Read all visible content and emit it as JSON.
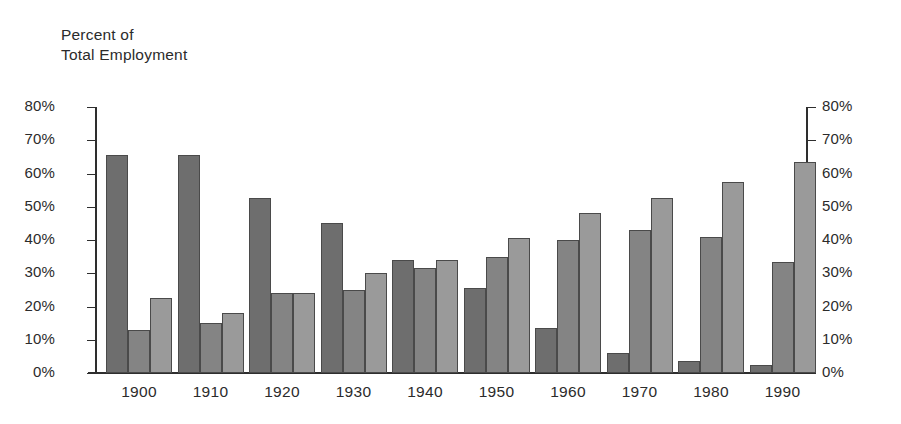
{
  "chart_data": {
    "type": "bar",
    "title": "",
    "axis_title": "Percent of\nTotal Employment",
    "xlabel": "",
    "ylabel": "Percent of Total Employment",
    "ylim": [
      0,
      80
    ],
    "grid": false,
    "legend_position": "none",
    "categories": [
      "1900",
      "1910",
      "1920",
      "1930",
      "1940",
      "1950",
      "1960",
      "1970",
      "1980",
      "1990"
    ],
    "ytick_labels": [
      "80%",
      "70%",
      "60%",
      "50%",
      "40%",
      "30%",
      "20%",
      "10%",
      "0%"
    ],
    "ytick_values": [
      80,
      70,
      60,
      50,
      40,
      30,
      20,
      10,
      0
    ],
    "right_axis_tick_labels": [
      "80%",
      "70%",
      "60%",
      "50%",
      "40%",
      "30%",
      "20%",
      "10%",
      "0%"
    ],
    "series": [
      {
        "name": "series-1",
        "color": "#6e6e6e",
        "values": [
          65.5,
          65.5,
          52.5,
          45.0,
          34.0,
          25.5,
          13.5,
          6.0,
          3.5,
          2.5
        ]
      },
      {
        "name": "series-2",
        "color": "#848484",
        "values": [
          13.0,
          15.0,
          24.0,
          25.0,
          31.5,
          35.0,
          40.0,
          43.0,
          41.0,
          33.5
        ]
      },
      {
        "name": "series-3",
        "color": "#9a9a9a",
        "values": [
          22.5,
          18.0,
          24.0,
          30.0,
          34.0,
          40.5,
          48.0,
          52.5,
          57.5,
          63.5
        ]
      }
    ]
  },
  "colors": {
    "axis": "#2e2e2e",
    "text": "#2b2b2b",
    "bar_outline": "#4a4a4a",
    "background": "#ffffff"
  }
}
